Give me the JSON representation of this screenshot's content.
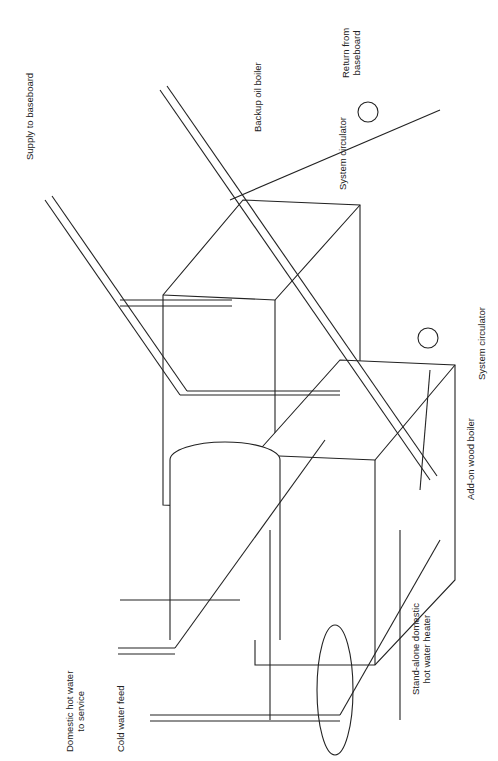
{
  "diagram": {
    "orientation": "rotated -90deg",
    "components": {
      "backup_oil_boiler": "Backup oil boiler",
      "add_on_wood_boiler": "Add-on wood boiler",
      "hot_water_heater": [
        "Stand-alone domestic",
        "hot water heater"
      ],
      "system_circulator_top": "System circulator",
      "system_circulator_bottom": "System circulator"
    },
    "connections": {
      "supply_to_baseboard": "Supply to baseboard",
      "return_from_baseboard": [
        "Return from",
        "baseboard"
      ],
      "domestic_hot_water": [
        "Domestic hot water",
        "to service"
      ],
      "cold_water_feed": "Cold water feed"
    },
    "colors": {
      "line": "#222222",
      "background": "#ffffff"
    }
  }
}
